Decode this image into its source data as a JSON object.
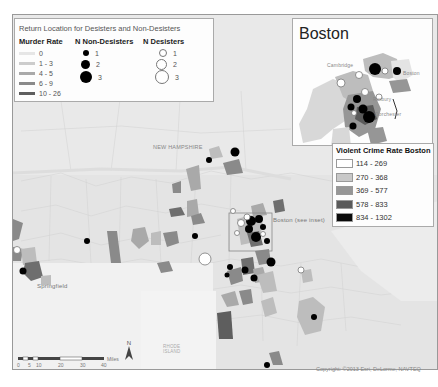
{
  "map": {
    "title": "Return Location for Desisters and Non-Desisters",
    "region_labels": {
      "new_hampshire": "NEW HAMPSHIRE",
      "springfield": "Springfield",
      "boston_see_inset": "Boston (see inset)",
      "rhode_island": "RHODE ISLAND"
    },
    "copyright": "Copyright: ©2013 Esri, DeLorme, NAVTEQ",
    "colors": {
      "background": "#e2e2e2",
      "town_border": "#cfcfcf",
      "non_desister": "#000000",
      "desister_fill": "#ffffff",
      "desister_stroke": "#777777"
    }
  },
  "legend": {
    "title": "Return Location for Desisters and Non-Desisters",
    "murder_rate": {
      "header": "Murder Rate",
      "items": [
        {
          "label": "0",
          "color": "#e6e6e6"
        },
        {
          "label": "1 - 3",
          "color": "#cccccc"
        },
        {
          "label": "4 - 5",
          "color": "#a9a9a9"
        },
        {
          "label": "6 - 9",
          "color": "#8a8a8a"
        },
        {
          "label": "10 - 26",
          "color": "#5e5e5e"
        }
      ]
    },
    "non_desisters": {
      "header": "N Non-Desisters",
      "items": [
        {
          "label": "1",
          "size": 7
        },
        {
          "label": "2",
          "size": 10
        },
        {
          "label": "3",
          "size": 13
        }
      ]
    },
    "desisters": {
      "header": "N Desisters",
      "items": [
        {
          "label": "1",
          "size": 7
        },
        {
          "label": "2",
          "size": 10
        },
        {
          "label": "3",
          "size": 13
        }
      ]
    }
  },
  "inset": {
    "title": "Boston",
    "labels": {
      "cambridge": "Cambridge",
      "boston": "Boston",
      "roxbury": "Roxbury",
      "dorchester": "Dorchester"
    }
  },
  "violent_crime_legend": {
    "header": "Violent Crime Rate Boston",
    "items": [
      {
        "label": "114 - 269",
        "color": "#ffffff"
      },
      {
        "label": "270 - 368",
        "color": "#c8c8c8"
      },
      {
        "label": "369 - 577",
        "color": "#969696"
      },
      {
        "label": "578 - 833",
        "color": "#5a5a5a"
      },
      {
        "label": "834 - 1302",
        "color": "#0a0a0a"
      }
    ]
  },
  "scale_bar": {
    "ticks": [
      "0",
      "5",
      "10",
      "20",
      "30",
      "40"
    ],
    "unit": "Miles",
    "north_label": "N"
  }
}
